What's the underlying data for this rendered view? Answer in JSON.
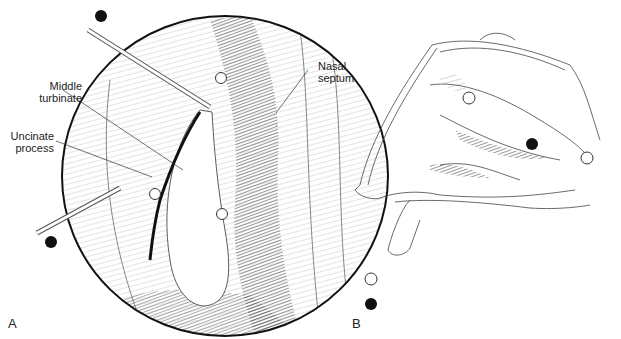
{
  "panel_a": {
    "letter": "A",
    "labels": {
      "middle_turbinate": [
        "Middle",
        "turbinate"
      ],
      "uncinate_process": [
        "Uncinate",
        "process"
      ],
      "nasal_septum": [
        "Nasal",
        "septum"
      ]
    }
  },
  "panel_b": {
    "letter": "B",
    "legend": [
      {
        "marker": "open-circle"
      },
      {
        "marker": "filled-circle"
      }
    ]
  }
}
